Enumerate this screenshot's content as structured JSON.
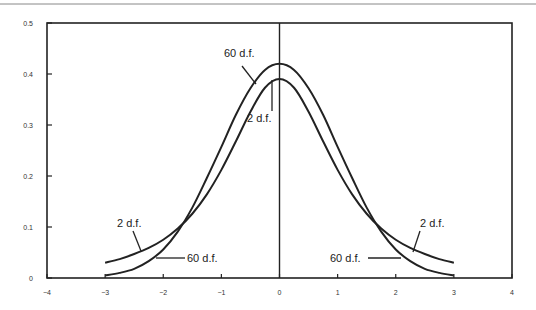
{
  "chart_data": {
    "type": "line",
    "title": "",
    "xlabel": "",
    "ylabel": "",
    "xlim": [
      -4,
      4
    ],
    "ylim": [
      0,
      0.5
    ],
    "grid": false,
    "legend": "inline labels with leader lines",
    "x_ticks": [
      "-4",
      "-3",
      "-2",
      "-1",
      "0",
      "1",
      "2",
      "3",
      "4"
    ],
    "y_ticks": [
      "0",
      "0.1",
      "0.2",
      "0.3",
      "0.4",
      "0.5"
    ],
    "vertical_reference_line_x": 0,
    "x": [
      -3.0,
      -2.75,
      -2.5,
      -2.25,
      -2.0,
      -1.75,
      -1.5,
      -1.25,
      -1.0,
      -0.75,
      -0.5,
      -0.25,
      0.0,
      0.25,
      0.5,
      0.75,
      1.0,
      1.25,
      1.5,
      1.75,
      2.0,
      2.25,
      2.5,
      2.75,
      3.0
    ],
    "series": [
      {
        "name": "60 d.f.",
        "values": [
          0.005,
          0.01,
          0.018,
          0.033,
          0.056,
          0.091,
          0.138,
          0.196,
          0.257,
          0.32,
          0.372,
          0.408,
          0.42,
          0.408,
          0.372,
          0.32,
          0.257,
          0.196,
          0.138,
          0.091,
          0.056,
          0.033,
          0.018,
          0.01,
          0.005
        ]
      },
      {
        "name": "2 d.f.",
        "values": [
          0.03,
          0.037,
          0.047,
          0.059,
          0.075,
          0.097,
          0.126,
          0.164,
          0.212,
          0.268,
          0.326,
          0.373,
          0.39,
          0.373,
          0.326,
          0.268,
          0.212,
          0.164,
          0.126,
          0.097,
          0.075,
          0.059,
          0.047,
          0.037,
          0.03
        ]
      }
    ],
    "annotations": [
      {
        "text": "60 d.f.",
        "position": "upper-left of peak",
        "points_to": "60 d.f."
      },
      {
        "text": "2 d.f.",
        "position": "below peak, left of center",
        "points_to": "2 d.f."
      },
      {
        "text": "2 d.f.",
        "position": "left tail",
        "points_to": "2 d.f."
      },
      {
        "text": "60 d.f.",
        "position": "left tail",
        "points_to": "60 d.f."
      },
      {
        "text": "60 d.f.",
        "position": "right tail",
        "points_to": "60 d.f."
      },
      {
        "text": "2 d.f.",
        "position": "right tail",
        "points_to": "2 d.f."
      }
    ]
  }
}
